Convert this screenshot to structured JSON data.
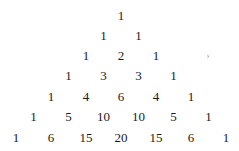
{
  "rows": [
    [
      "1"
    ],
    [
      "1",
      "1"
    ],
    [
      "1",
      "2",
      "1"
    ],
    [
      "1",
      "3",
      "3",
      "1"
    ],
    [
      "1",
      "4",
      "6",
      "4",
      "1"
    ],
    [
      "1",
      "5",
      "10",
      "10",
      "5",
      "1"
    ],
    [
      "1",
      "6",
      "15",
      "20",
      "15",
      "6",
      "1"
    ]
  ],
  "stray_mark": "›"
}
